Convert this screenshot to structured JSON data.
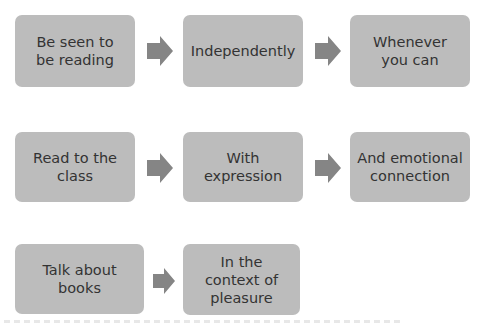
{
  "diagram": {
    "colors": {
      "box_fill": "#bcbcbc",
      "arrow_fill": "#858585",
      "text": "#333333",
      "background": "#ffffff"
    },
    "rows": [
      {
        "boxes": [
          {
            "label": "Be seen to be reading"
          },
          {
            "label": "Independently"
          },
          {
            "label": "Whenever you can"
          }
        ]
      },
      {
        "boxes": [
          {
            "label": "Read to the class"
          },
          {
            "label": "With expression"
          },
          {
            "label": "And emotional connection"
          }
        ]
      },
      {
        "boxes": [
          {
            "label": "Talk about books"
          },
          {
            "label": "In the context of pleasure"
          }
        ]
      }
    ],
    "arrow_icon": "right-arrow-icon"
  }
}
